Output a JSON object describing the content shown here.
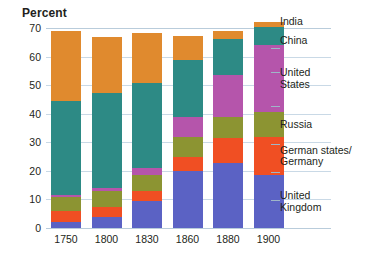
{
  "chart_data": {
    "type": "bar",
    "subtype": "stacked-bar",
    "title": "",
    "xlabel": "",
    "ylabel": "Percent",
    "ylim": [
      0,
      70
    ],
    "yticks": [
      0,
      10,
      20,
      30,
      40,
      50,
      60,
      70
    ],
    "grid": true,
    "legend_position": "right",
    "categories": [
      "1750",
      "1800",
      "1830",
      "1860",
      "1880",
      "1900"
    ],
    "series": [
      {
        "name": "United Kingdom",
        "color": "#5b62c4",
        "values": [
          2,
          4,
          9.5,
          19.9,
          22.9,
          18.5
        ]
      },
      {
        "name": "German states/\nGermany",
        "color": "#f04f23",
        "values": [
          4,
          3.5,
          3.5,
          4.9,
          8.5,
          13.2
        ]
      },
      {
        "name": "Russia",
        "color": "#8c9432",
        "values": [
          5,
          5.6,
          5.6,
          7,
          7.6,
          8.8
        ]
      },
      {
        "name": "United States",
        "color": "#b555ab",
        "values": [
          0.6,
          0.8,
          2.4,
          7.2,
          14.7,
          23.6
        ]
      },
      {
        "name": "China",
        "color": "#2d8a85",
        "values": [
          32.8,
          33.3,
          29.8,
          19.7,
          12.5,
          6.2
        ]
      },
      {
        "name": "India",
        "color": "#e08a2e",
        "values": [
          24.5,
          19.7,
          17.6,
          8.6,
          2.8,
          1.7
        ]
      }
    ],
    "totals": [
      68.9,
      66.9,
      68.4,
      67.3,
      69,
      72
    ],
    "legend_entries": [
      {
        "label": "India",
        "color": "#e08a2e"
      },
      {
        "label": "China",
        "color": "#2d8a85"
      },
      {
        "label": "United\nStates",
        "color": "#b555ab"
      },
      {
        "label": "Russia",
        "color": "#8c9432"
      },
      {
        "label": "German states/\nGermany",
        "color": "#f04f23"
      },
      {
        "label": "United\nKingdom",
        "color": "#5b62c4"
      }
    ]
  },
  "axis": {
    "y_title": "Percent",
    "y_labels": [
      "70",
      "60",
      "50",
      "40",
      "30",
      "20",
      "10",
      "0"
    ],
    "x_labels": [
      "1750",
      "1800",
      "1830",
      "1860",
      "1880",
      "1900"
    ]
  },
  "legend": {
    "india": "India",
    "china": "China",
    "united_states": "United\nStates",
    "russia": "Russia",
    "germany": "German states/\nGermany",
    "united_kingdom": "United\nKingdom"
  }
}
